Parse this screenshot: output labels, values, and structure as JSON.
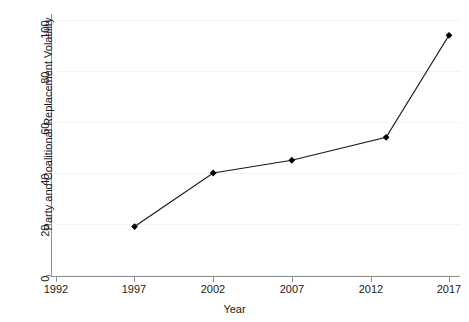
{
  "chart_data": {
    "type": "line",
    "title": "",
    "xlabel": "Year",
    "ylabel": "Party and Coalitional Replacement Volatility",
    "x": [
      1997,
      2002,
      2007,
      2013,
      2017
    ],
    "values": [
      19,
      40,
      45,
      54,
      94
    ],
    "series": [
      {
        "name": "Party and Coalitional Replacement Volatility",
        "x": [
          1997,
          2002,
          2007,
          2013,
          2017
        ],
        "values": [
          19,
          40,
          45,
          54,
          94
        ]
      }
    ],
    "xlim": [
      1992,
      2017.8
    ],
    "ylim": [
      0,
      100
    ],
    "xticks": [
      1992,
      1997,
      2002,
      2007,
      2012,
      2017
    ],
    "xticklabels": [
      "1992",
      "1997",
      "2002",
      "2007",
      "2012",
      "2017"
    ],
    "yticks": [
      0,
      20,
      40,
      60,
      80,
      100
    ],
    "yticklabels": [
      "0",
      "20",
      "40",
      "60",
      "80",
      "100"
    ],
    "grid": "horizontal-faint",
    "legend": "none",
    "marker": "diamond",
    "line_color": "#1a1a1a",
    "marker_color": "#000000",
    "grid_color": "#f3f3f3",
    "axis_color": "#8e8e8e",
    "background": "#ffffff"
  }
}
